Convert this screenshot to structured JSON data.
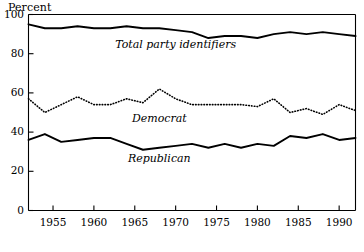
{
  "chart_data": {
    "type": "line",
    "title": "",
    "subtitle": "",
    "xlabel": "",
    "ylabel": "Percent",
    "ylim": [
      0,
      100
    ],
    "xlim": [
      1952,
      1992
    ],
    "grid": false,
    "legend_position": "inline-annotations",
    "yticks": [
      0,
      20,
      40,
      60,
      80,
      100
    ],
    "ytick_labels": [
      "0",
      "20",
      "40",
      "60",
      "80",
      "100"
    ],
    "xticks": [
      1955,
      1960,
      1965,
      1970,
      1975,
      1980,
      1985,
      1990
    ],
    "xtick_labels": [
      "1955",
      "1960",
      "1965",
      "1970",
      "1975",
      "1980",
      "1985",
      "1990"
    ],
    "x": [
      1952,
      1954,
      1956,
      1958,
      1960,
      1962,
      1964,
      1966,
      1968,
      1970,
      1972,
      1974,
      1976,
      1978,
      1980,
      1982,
      1984,
      1986,
      1988,
      1990,
      1992
    ],
    "series": [
      {
        "name": "Total party identifiers",
        "style": "solid",
        "color": "#000000",
        "values": [
          95,
          93,
          93,
          94,
          93,
          93,
          94,
          93,
          93,
          92,
          91,
          88,
          89,
          89,
          88,
          90,
          91,
          90,
          91,
          90,
          89
        ]
      },
      {
        "name": "Democrat",
        "style": "dotted",
        "color": "#000000",
        "values": [
          57,
          50,
          54,
          58,
          54,
          54,
          57,
          55,
          62,
          57,
          54,
          54,
          54,
          54,
          53,
          57,
          50,
          52,
          49,
          54,
          51
        ]
      },
      {
        "name": "Republican",
        "style": "solid",
        "color": "#000000",
        "values": [
          36,
          39,
          35,
          36,
          37,
          37,
          34,
          31,
          32,
          33,
          34,
          32,
          34,
          32,
          34,
          33,
          38,
          37,
          39,
          36,
          37
        ]
      }
    ],
    "annotations": [
      {
        "text": "Total party identifiers",
        "x": 1970,
        "y": 84
      },
      {
        "text": "Democrat",
        "x": 1968,
        "y": 46
      },
      {
        "text": "Republican",
        "x": 1968,
        "y": 26
      }
    ]
  },
  "axis": {
    "y_title": "Percent"
  }
}
